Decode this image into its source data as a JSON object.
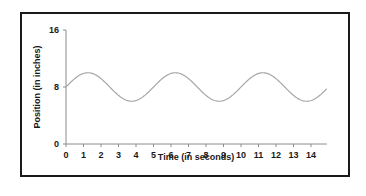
{
  "chart_data": {
    "type": "line",
    "title": "",
    "xlabel": "Time (in seconds)",
    "ylabel": "Position (in inches)",
    "xlim": [
      0,
      14.9
    ],
    "ylim": [
      0,
      16
    ],
    "x_ticks": [
      0,
      1,
      2,
      3,
      4,
      5,
      6,
      7,
      8,
      9,
      10,
      11,
      12,
      13,
      14
    ],
    "y_ticks": [
      0,
      8,
      16
    ],
    "grid": false,
    "legend": null,
    "series": [
      {
        "name": "Position",
        "color": "#a6a6a6",
        "model": "y = 8 + 2*sin(2*pi*t/5)",
        "midline": 8,
        "amplitude": 2,
        "period": 5,
        "x": [
          0,
          0.5,
          1,
          1.25,
          1.5,
          2,
          2.5,
          3,
          3.5,
          3.75,
          4,
          4.5,
          5,
          5.5,
          6,
          6.25,
          6.5,
          7,
          7.5,
          8,
          8.5,
          8.75,
          9,
          9.5,
          10,
          10.5,
          11,
          11.25,
          11.5,
          12,
          12.5,
          13,
          13.5,
          13.75,
          14,
          14.5,
          14.9
        ],
        "values": [
          8,
          9.18,
          9.9,
          10,
          9.9,
          9.18,
          8,
          6.82,
          6.1,
          6,
          6.1,
          6.82,
          8,
          9.18,
          9.9,
          10,
          9.9,
          9.18,
          8,
          6.82,
          6.1,
          6,
          6.1,
          6.82,
          8,
          9.18,
          9.9,
          10,
          9.9,
          9.18,
          8,
          6.82,
          6.1,
          6,
          6.1,
          6.82,
          7.75
        ]
      }
    ]
  },
  "axes": {
    "x_title": "Time (in seconds)",
    "y_title": "Position (in inches)",
    "x_tick_labels": [
      "0",
      "1",
      "2",
      "3",
      "4",
      "5",
      "6",
      "7",
      "8",
      "9",
      "10",
      "11",
      "12",
      "13",
      "14"
    ],
    "y_tick_labels": [
      "0",
      "8",
      "16"
    ]
  },
  "colors": {
    "frame": "#1a1a1a",
    "axis": "#8c8c8c",
    "curve": "#a6a6a6",
    "text": "#1a1a1a"
  }
}
